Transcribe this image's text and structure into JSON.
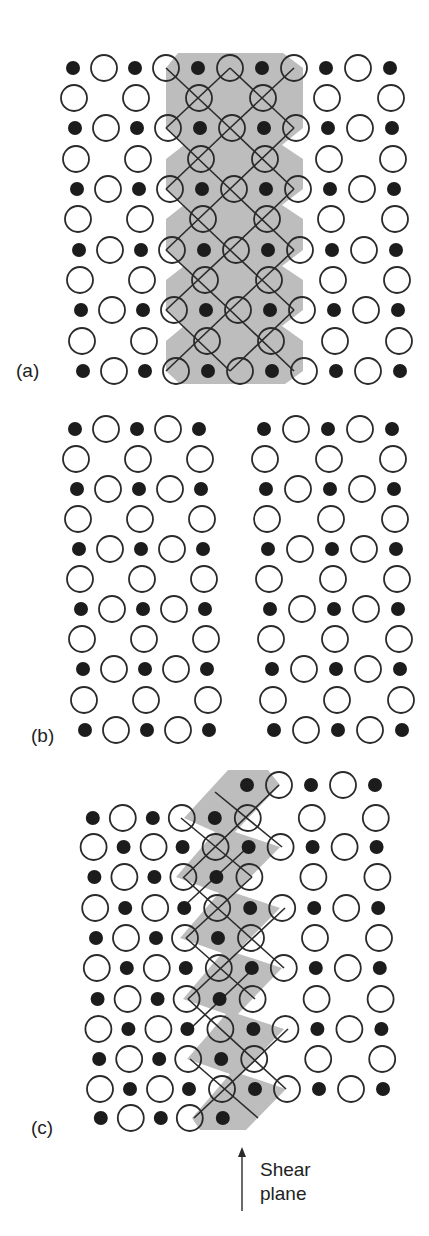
{
  "figure": {
    "colors": {
      "ion_fill": "#1c1c1c",
      "ring_stroke": "#2a2a2a",
      "shade": "#bdbdbd",
      "background": "#ffffff",
      "text": "#222222"
    },
    "legend_semantics": {
      "small_filled_circle": "cation",
      "large_open_circle": "anion",
      "crossed_circle": "anion shared between octahedra",
      "shaded_diamond": "octahedron"
    }
  },
  "panels": [
    {
      "id": "a",
      "label": "(a)",
      "label_pos": [
        28,
        371
      ],
      "description": "perfect lattice with column of edge-sharing octahedra",
      "rows_y": [
        68,
        98,
        128,
        159,
        189,
        219,
        250,
        280,
        310,
        341,
        371
      ],
      "cols_x_top": [
        73,
        104,
        135,
        166,
        198,
        230,
        262,
        294,
        326,
        358,
        390
      ],
      "skew_per_row": 1.0,
      "row_types": [
        "A",
        "B",
        "A",
        "B",
        "A",
        "B",
        "A",
        "B",
        "A",
        "B",
        "A"
      ],
      "row_A": [
        "dot",
        "open",
        "dot",
        "open",
        "dot",
        "open",
        "dot",
        "open",
        "dot",
        "open",
        "dot"
      ],
      "row_B": [
        "open",
        "",
        "open",
        "",
        "cross",
        "",
        "cross",
        "",
        "open",
        "",
        "open"
      ],
      "shade_polygon": [
        [
          178,
          53
        ],
        [
          283,
          53
        ],
        [
          303,
          68
        ],
        [
          303,
          128
        ],
        [
          282,
          145
        ],
        [
          303,
          159
        ],
        [
          303,
          189
        ],
        [
          282,
          205
        ],
        [
          303,
          219
        ],
        [
          303,
          250
        ],
        [
          282,
          266
        ],
        [
          303,
          280
        ],
        [
          303,
          310
        ],
        [
          282,
          326
        ],
        [
          303,
          341
        ],
        [
          303,
          371
        ],
        [
          285,
          384
        ],
        [
          180,
          384
        ],
        [
          166,
          371
        ],
        [
          166,
          341
        ],
        [
          184,
          326
        ],
        [
          166,
          310
        ],
        [
          166,
          280
        ],
        [
          184,
          266
        ],
        [
          166,
          250
        ],
        [
          166,
          219
        ],
        [
          184,
          205
        ],
        [
          166,
          189
        ],
        [
          166,
          159
        ],
        [
          184,
          145
        ],
        [
          166,
          128
        ],
        [
          166,
          68
        ]
      ],
      "lines": [
        [
          [
            166,
            68
          ],
          [
            230,
            128
          ]
        ],
        [
          [
            230,
            68
          ],
          [
            294,
            128
          ]
        ],
        [
          [
            230,
            68
          ],
          [
            166,
            128
          ]
        ],
        [
          [
            294,
            68
          ],
          [
            230,
            128
          ]
        ],
        [
          [
            166,
            128
          ],
          [
            230,
            189
          ]
        ],
        [
          [
            230,
            128
          ],
          [
            294,
            189
          ]
        ],
        [
          [
            230,
            128
          ],
          [
            166,
            189
          ]
        ],
        [
          [
            294,
            128
          ],
          [
            230,
            189
          ]
        ],
        [
          [
            166,
            189
          ],
          [
            230,
            250
          ]
        ],
        [
          [
            230,
            189
          ],
          [
            294,
            250
          ]
        ],
        [
          [
            230,
            189
          ],
          [
            166,
            250
          ]
        ],
        [
          [
            294,
            189
          ],
          [
            230,
            250
          ]
        ],
        [
          [
            166,
            250
          ],
          [
            230,
            310
          ]
        ],
        [
          [
            230,
            250
          ],
          [
            294,
            310
          ]
        ],
        [
          [
            230,
            250
          ],
          [
            166,
            310
          ]
        ],
        [
          [
            294,
            250
          ],
          [
            230,
            310
          ]
        ],
        [
          [
            166,
            310
          ],
          [
            230,
            371
          ]
        ],
        [
          [
            230,
            310
          ],
          [
            294,
            371
          ]
        ],
        [
          [
            230,
            310
          ],
          [
            166,
            371
          ]
        ],
        [
          [
            294,
            310
          ],
          [
            230,
            371
          ]
        ]
      ]
    },
    {
      "id": "b",
      "label": "(b)",
      "label_pos": [
        43,
        736
      ],
      "description": "crystal with column removed, two halves separated",
      "rows_y": [
        429,
        459,
        489,
        519,
        549,
        579,
        609,
        639,
        669,
        700,
        730
      ],
      "skew_per_row": 1.0,
      "blocks": [
        {
          "cols_x_top": [
            75,
            106,
            137,
            168,
            199
          ]
        },
        {
          "cols_x_top": [
            264,
            296,
            328,
            360,
            392
          ]
        }
      ],
      "row_types": [
        "A",
        "B",
        "A",
        "B",
        "A",
        "B",
        "A",
        "B",
        "A",
        "B",
        "A"
      ],
      "row_A": [
        "dot",
        "open",
        "dot",
        "open",
        "dot"
      ],
      "row_B": [
        "open",
        "",
        "open",
        "",
        "open"
      ]
    },
    {
      "id": "c",
      "label": "(c)",
      "label_pos": [
        43,
        1128
      ],
      "description": "halves rejoined after shear, octahedra share edges along shear plane",
      "rows_y": [
        785,
        818,
        847,
        877,
        908,
        938,
        968,
        999,
        1029,
        1059,
        1089,
        1118
      ],
      "cols_x_top": [
        92,
        122,
        152,
        181,
        214,
        247,
        279,
        311,
        343,
        375
      ],
      "skew_per_row": 0.8,
      "row_types": [
        "B1",
        "A",
        "B",
        "A",
        "B",
        "A",
        "B",
        "A",
        "B",
        "A",
        "B",
        "A2"
      ],
      "row_A": [
        "dot",
        "open",
        "dot",
        "open",
        "dot",
        "cross",
        "",
        "open",
        "",
        "open"
      ],
      "row_B": [
        "open",
        "dot",
        "open",
        "dot",
        "cross",
        "dot",
        "open",
        "dot",
        "open",
        "dot"
      ],
      "row_B1": [
        "",
        "",
        "",
        "",
        "",
        "dot",
        "open",
        "dot",
        "open",
        "dot"
      ],
      "row_A2": [
        "dot",
        "open",
        "dot",
        "open",
        "dot",
        "",
        "",
        "",
        "",
        ""
      ],
      "shade_polygon": [
        [
          228,
          770
        ],
        [
          268,
          770
        ],
        [
          280,
          785
        ],
        [
          235,
          832
        ],
        [
          280,
          847
        ],
        [
          235,
          893
        ],
        [
          280,
          908
        ],
        [
          236,
          953
        ],
        [
          282,
          968
        ],
        [
          238,
          1014
        ],
        [
          284,
          1029
        ],
        [
          241,
          1074
        ],
        [
          286,
          1089
        ],
        [
          246,
          1130
        ],
        [
          200,
          1130
        ],
        [
          192,
          1118
        ],
        [
          230,
          1074
        ],
        [
          187,
          1059
        ],
        [
          226,
          1014
        ],
        [
          183,
          999
        ],
        [
          222,
          953
        ],
        [
          180,
          938
        ],
        [
          219,
          893
        ],
        [
          176,
          877
        ],
        [
          215,
          832
        ],
        [
          184,
          818
        ]
      ],
      "lines": [
        [
          [
            215,
            792
          ],
          [
            282,
            847
          ]
        ],
        [
          [
            279,
            785
          ],
          [
            184,
            877
          ]
        ],
        [
          [
            181,
            818
          ],
          [
            252,
            877
          ]
        ],
        [
          [
            248,
            847
          ],
          [
            182,
            908
          ]
        ],
        [
          [
            183,
            877
          ],
          [
            284,
            968
          ]
        ],
        [
          [
            252,
            877
          ],
          [
            186,
            938
          ]
        ],
        [
          [
            186,
            938
          ],
          [
            255,
            999
          ]
        ],
        [
          [
            285,
            908
          ],
          [
            188,
            999
          ]
        ],
        [
          [
            188,
            999
          ],
          [
            286,
            1089
          ]
        ],
        [
          [
            254,
            968
          ],
          [
            190,
            1029
          ]
        ],
        [
          [
            190,
            1059
          ],
          [
            258,
            1118
          ]
        ],
        [
          [
            288,
            1029
          ],
          [
            194,
            1118
          ]
        ]
      ]
    }
  ],
  "annotation": {
    "arrow": {
      "x": 242,
      "y_tip": 1147,
      "y_tail": 1211
    },
    "line1": "Shear",
    "line2": "plane",
    "text_pos": [
      260,
      1158
    ]
  }
}
